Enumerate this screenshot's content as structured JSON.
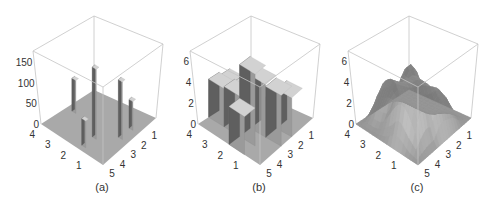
{
  "figure": {
    "captions": [
      "(a)",
      "(b)",
      "(c)"
    ]
  },
  "colors": {
    "frame": "#c4c4c4",
    "floor": "#a9a9a9",
    "bar_dark": "#5f5f5f",
    "bar_mid": "#9a9a9a",
    "bar_top": "#d2d2d2",
    "label": "#333333"
  },
  "chart_data": [
    {
      "panel": "(a)",
      "type": "bar3d",
      "style": "thin-columns",
      "x_ticks": [
        "1",
        "2",
        "3",
        "4",
        "5"
      ],
      "y_ticks": [
        "1",
        "2",
        "3",
        "4"
      ],
      "z_ticks": [
        "0",
        "50",
        "100",
        "150"
      ],
      "zlim": [
        0,
        180
      ],
      "bars": [
        {
          "x": 4,
          "y": 2,
          "z": 170
        },
        {
          "x": 3,
          "y": 1,
          "z": 140
        },
        {
          "x": 3,
          "y": 4,
          "z": 80
        },
        {
          "x": 2,
          "y": 1,
          "z": 70
        },
        {
          "x": 5,
          "y": 2,
          "z": 65
        }
      ]
    },
    {
      "panel": "(b)",
      "type": "bar3d",
      "style": "blocks",
      "x_ticks": [
        "1",
        "2",
        "3",
        "4",
        "5"
      ],
      "y_ticks": [
        "1",
        "2",
        "3",
        "4"
      ],
      "z_ticks": [
        "0",
        "2",
        "4",
        "6"
      ],
      "zlim": [
        0,
        7
      ],
      "bars": [
        {
          "x": 4,
          "y": 2,
          "z": 6.8
        },
        {
          "x": 3,
          "y": 2,
          "z": 5.0
        },
        {
          "x": 3,
          "y": 1,
          "z": 4.8
        },
        {
          "x": 4,
          "y": 3,
          "z": 3.8
        },
        {
          "x": 2,
          "y": 1,
          "z": 3.7
        },
        {
          "x": 5,
          "y": 2,
          "z": 3.6
        },
        {
          "x": 3,
          "y": 3,
          "z": 3.6
        },
        {
          "x": 4,
          "y": 4,
          "z": 3.6
        },
        {
          "x": 3,
          "y": 4,
          "z": 3.3
        }
      ]
    },
    {
      "panel": "(c)",
      "type": "surface",
      "x_ticks": [
        "1",
        "2",
        "3",
        "4",
        "5"
      ],
      "y_ticks": [
        "1",
        "2",
        "3",
        "4"
      ],
      "z_ticks": [
        "0",
        "2",
        "4",
        "6"
      ],
      "zlim": [
        0,
        7
      ],
      "peak": {
        "x": 4,
        "y": 2,
        "z": 6.8
      },
      "description": "smooth interpolated surface of the panel (b) block heights"
    }
  ]
}
